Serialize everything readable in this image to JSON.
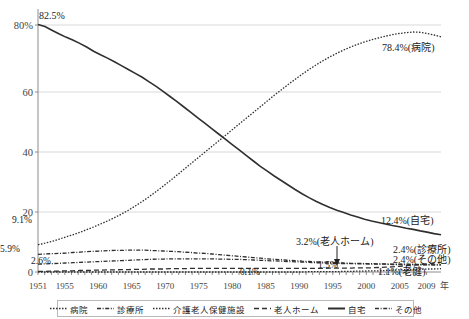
{
  "chart_data": {
    "type": "line",
    "title": "",
    "xlabel": "年",
    "ylabel": "",
    "ylim": [
      0,
      85
    ],
    "xlim": [
      1951,
      2009
    ],
    "grid": true,
    "legend_position": "bottom",
    "ytick_labels": [
      "0",
      "20",
      "40",
      "60",
      "80%"
    ],
    "ytick_values": [
      0,
      20,
      40,
      60,
      80
    ],
    "xtick_labels": [
      "1951",
      "1955",
      "1960",
      "1965",
      "1970",
      "1975",
      "1980",
      "1985",
      "1990",
      "1995",
      "2000",
      "2005",
      "2009"
    ],
    "xtick_values": [
      1951,
      1955,
      1960,
      1965,
      1970,
      1975,
      1980,
      1985,
      1990,
      1995,
      2000,
      2005,
      2009
    ],
    "x": [
      1951,
      1952,
      1953,
      1954,
      1955,
      1956,
      1957,
      1958,
      1959,
      1960,
      1961,
      1962,
      1963,
      1964,
      1965,
      1966,
      1967,
      1968,
      1969,
      1970,
      1971,
      1972,
      1973,
      1974,
      1975,
      1976,
      1977,
      1978,
      1979,
      1980,
      1981,
      1982,
      1983,
      1984,
      1985,
      1986,
      1987,
      1988,
      1989,
      1990,
      1991,
      1992,
      1993,
      1994,
      1995,
      1996,
      1997,
      1998,
      1999,
      2000,
      2001,
      2002,
      2003,
      2004,
      2005,
      2006,
      2007,
      2008,
      2009
    ],
    "series": [
      {
        "name": "病院",
        "style": "dotted",
        "end_label": "78.4%(病院)",
        "start_label": "9.1%",
        "values": [
          9.1,
          9.6,
          10.2,
          10.9,
          11.7,
          12.4,
          13.2,
          14.1,
          15.0,
          16.0,
          17.0,
          18.1,
          19.3,
          20.6,
          22.0,
          23.5,
          25.1,
          26.8,
          28.6,
          30.4,
          32.3,
          34.2,
          36.1,
          38.0,
          39.9,
          41.8,
          43.7,
          45.6,
          47.5,
          49.4,
          51.3,
          53.2,
          55.1,
          57.0,
          58.9,
          60.7,
          62.5,
          64.2,
          65.9,
          67.5,
          69.0,
          70.4,
          71.7,
          72.9,
          74.0,
          75.0,
          75.9,
          76.7,
          77.4,
          78.0,
          78.6,
          79.1,
          79.5,
          79.8,
          80.0,
          79.9,
          79.5,
          79.0,
          78.4
        ]
      },
      {
        "name": "診療所",
        "style": "dashdot",
        "end_label": "2.4%(診療所)",
        "start_label": "5.9%",
        "values": [
          5.9,
          6.0,
          6.1,
          6.2,
          6.3,
          6.5,
          6.6,
          6.8,
          6.9,
          7.0,
          7.1,
          7.2,
          7.2,
          7.3,
          7.3,
          7.3,
          7.2,
          7.1,
          7.0,
          6.9,
          6.8,
          6.6,
          6.5,
          6.3,
          6.2,
          6.0,
          5.8,
          5.6,
          5.4,
          5.2,
          5.0,
          4.8,
          4.6,
          4.4,
          4.2,
          4.1,
          3.9,
          3.8,
          3.6,
          3.5,
          3.4,
          3.3,
          3.2,
          3.1,
          3.0,
          2.9,
          2.9,
          2.8,
          2.8,
          2.7,
          2.7,
          2.6,
          2.6,
          2.6,
          2.5,
          2.5,
          2.5,
          2.4,
          2.4
        ]
      },
      {
        "name": "介護老人保健施設",
        "style": "dotted",
        "end_label": "1.1%(老健)",
        "start_label": "0.1%",
        "values": [
          0,
          0,
          0,
          0,
          0,
          0,
          0,
          0,
          0,
          0,
          0,
          0,
          0,
          0,
          0,
          0,
          0,
          0,
          0,
          0,
          0,
          0,
          0,
          0,
          0,
          0,
          0,
          0,
          0,
          0,
          0,
          0,
          0,
          0,
          0,
          0,
          0,
          0,
          0,
          0.1,
          0.1,
          0.1,
          0.1,
          0.1,
          0.2,
          0.2,
          0.3,
          0.3,
          0.4,
          0.4,
          0.5,
          0.6,
          0.7,
          0.8,
          0.9,
          0.9,
          1.0,
          1.0,
          1.1
        ]
      },
      {
        "name": "老人ホーム",
        "style": "dashed",
        "end_label": "3.2%(老人ホーム)",
        "mid_label": "1.5%",
        "values": [
          0.2,
          0.2,
          0.3,
          0.3,
          0.4,
          0.4,
          0.5,
          0.5,
          0.6,
          0.6,
          0.7,
          0.7,
          0.8,
          0.8,
          0.9,
          0.9,
          1.0,
          1.0,
          1.0,
          1.1,
          1.1,
          1.1,
          1.2,
          1.2,
          1.2,
          1.2,
          1.2,
          1.2,
          1.2,
          1.2,
          1.2,
          1.2,
          1.2,
          1.2,
          1.2,
          1.2,
          1.2,
          1.2,
          1.2,
          1.2,
          1.2,
          1.2,
          1.3,
          1.3,
          1.3,
          1.3,
          1.4,
          1.4,
          1.4,
          1.5,
          1.6,
          1.7,
          1.9,
          2.1,
          2.3,
          2.5,
          2.7,
          3.0,
          3.2
        ]
      },
      {
        "name": "自宅",
        "style": "solid",
        "start_label": "82.5%",
        "end_label": "12.4%(自宅)",
        "values": [
          82.5,
          81.8,
          80.6,
          79.4,
          78.3,
          77.3,
          76.2,
          75.0,
          73.6,
          72.4,
          71.3,
          70.1,
          68.8,
          67.5,
          66.2,
          64.9,
          63.4,
          61.9,
          60.2,
          58.5,
          56.8,
          55.0,
          53.2,
          51.4,
          49.6,
          47.8,
          46.0,
          44.2,
          42.4,
          40.6,
          38.8,
          37.0,
          35.2,
          33.6,
          32.0,
          30.5,
          29.0,
          27.5,
          26.1,
          24.8,
          23.6,
          22.5,
          21.5,
          20.6,
          19.8,
          19.0,
          18.3,
          17.6,
          17.0,
          16.5,
          16.0,
          15.5,
          15.1,
          14.6,
          14.2,
          13.7,
          13.3,
          12.8,
          12.4
        ]
      },
      {
        "name": "その他",
        "style": "dashdot",
        "end_label": "2.4%(その他)",
        "start_label": "2.6%",
        "values": [
          2.6,
          2.7,
          2.8,
          2.9,
          3.0,
          3.1,
          3.2,
          3.3,
          3.4,
          3.5,
          3.6,
          3.7,
          3.8,
          3.9,
          4.0,
          4.1,
          4.2,
          4.3,
          4.3,
          4.4,
          4.4,
          4.4,
          4.4,
          4.4,
          4.4,
          4.4,
          4.3,
          4.3,
          4.2,
          4.2,
          4.1,
          4.0,
          3.9,
          3.8,
          3.7,
          3.6,
          3.5,
          3.4,
          3.3,
          3.2,
          3.1,
          3.0,
          2.9,
          2.9,
          2.8,
          2.8,
          2.7,
          2.7,
          2.6,
          2.6,
          2.6,
          2.5,
          2.5,
          2.5,
          2.5,
          2.4,
          2.4,
          2.4,
          2.4
        ]
      }
    ],
    "annotations": [
      {
        "name": "jitaku-start",
        "text": "82.5%"
      },
      {
        "name": "byoin-start",
        "text": "9.1%"
      },
      {
        "name": "shinryojo-start",
        "text": "5.9%"
      },
      {
        "name": "sonota-start",
        "text": "2.6%"
      },
      {
        "name": "byoin-end",
        "text": "78.4%(病院)"
      },
      {
        "name": "jitaku-end",
        "text": "12.4%(自宅)"
      },
      {
        "name": "roujin-home",
        "text": "3.2%(老人ホーム)"
      },
      {
        "name": "shinryojo-end",
        "text": "2.4%(診療所)"
      },
      {
        "name": "sonota-end",
        "text": "2.4%(その他)"
      },
      {
        "name": "roken-end",
        "text": "1.1%(老健)"
      },
      {
        "name": "roken-start",
        "text": "0.1%"
      },
      {
        "name": "roujin-home-mid",
        "text": "1.5%"
      }
    ],
    "colors": {
      "line": "#2f2f2f",
      "grid": "#d9d9d9",
      "axis": "#8c8c8c",
      "text": "#222222"
    }
  },
  "legend": {
    "items": [
      {
        "label": "病院",
        "style": "dotted"
      },
      {
        "label": "診療所",
        "style": "dashdot"
      },
      {
        "label": "介護老人保健施設",
        "style": "dotted"
      },
      {
        "label": "老人ホーム",
        "style": "dashed"
      },
      {
        "label": "自宅",
        "style": "solid"
      },
      {
        "label": "その他",
        "style": "dashdot"
      }
    ]
  },
  "axis": {
    "y_labels": [
      "80%",
      "60",
      "40",
      "20",
      "0"
    ],
    "x_labels": [
      "1951",
      "1955",
      "1960",
      "1965",
      "1970",
      "1975",
      "1980",
      "1985",
      "1990",
      "1995",
      "2000",
      "2005",
      "2009"
    ],
    "x_unit": "年"
  }
}
